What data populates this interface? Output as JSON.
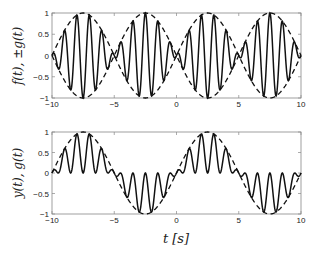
{
  "chart_data": [
    {
      "type": "line",
      "title": "",
      "xlabel": "",
      "ylabel": "f(t), ±g(t)",
      "xlim": [
        -10,
        10
      ],
      "ylim": [
        -1,
        1
      ],
      "xticks": [
        "-10",
        "-5",
        "0",
        "5",
        "10"
      ],
      "yticks": [
        "1",
        "0.5",
        "0",
        "-0.5",
        "-1"
      ],
      "grid": false,
      "series": [
        {
          "name": "f(t)",
          "style": "solid",
          "formula": "sin(pi*t/5)*cos(2*pi*(t-2))"
        },
        {
          "name": "+g(t)",
          "style": "dashed",
          "formula": "sin(pi*t/5)"
        },
        {
          "name": "-g(t)",
          "style": "dashed",
          "formula": "-sin(pi*t/5)"
        }
      ]
    },
    {
      "type": "line",
      "title": "",
      "xlabel": "t [s]",
      "ylabel": "y(t), g(t)",
      "xlim": [
        -10,
        10
      ],
      "ylim": [
        -1,
        1
      ],
      "xticks": [
        "-10",
        "-5",
        "0",
        "5",
        "10"
      ],
      "yticks": [
        "1",
        "0.5",
        "0",
        "-0.5",
        "-1"
      ],
      "grid": false,
      "series": [
        {
          "name": "y(t)",
          "style": "solid",
          "formula": "sin(pi*t/5)*(1+cos(2*pi*(t-2)))/2"
        },
        {
          "name": "g(t)",
          "style": "dashed",
          "formula": "sin(pi*t/5)"
        }
      ]
    }
  ],
  "labels": {
    "top_ylabel": "f(t), ±g(t)",
    "bottom_ylabel": "y(t), g(t)",
    "xlabel": "t [s]"
  },
  "colors": {
    "line": "#111111",
    "axes": "#888888"
  }
}
